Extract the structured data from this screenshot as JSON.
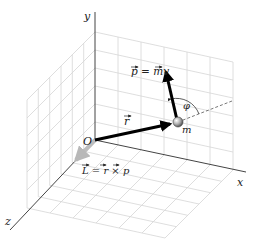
{
  "figure": {
    "axes": {
      "x_label": "x",
      "y_label": "y",
      "z_label": "z"
    },
    "origin_label": "O",
    "mass_label": "m",
    "position_vector_label": "r",
    "momentum_label": "p = mv",
    "angular_momentum_label": "L = r × p",
    "angle_label": "φ",
    "colors": {
      "grid": "#d4d4d4",
      "axis": "#333333",
      "vector": "#000000",
      "angular_momentum_vector": "#b8b8b8",
      "mass": "#999999"
    }
  }
}
